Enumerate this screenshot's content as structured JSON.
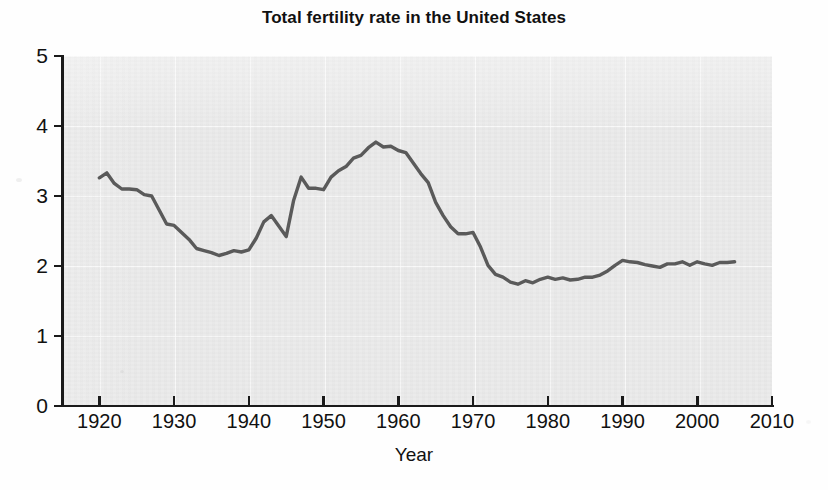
{
  "chart_data": {
    "type": "line",
    "title": "Total fertility rate in the United States",
    "xlabel": "Year",
    "ylabel": "",
    "xlim": [
      1915,
      2010
    ],
    "ylim": [
      0,
      5
    ],
    "xticks": [
      1920,
      1930,
      1940,
      1950,
      1960,
      1970,
      1980,
      1990,
      2000,
      2010
    ],
    "yticks": [
      0,
      1,
      2,
      3,
      4,
      5
    ],
    "grid": true,
    "legend": "none",
    "series": [
      {
        "name": "Total fertility rate",
        "color": "#5a5a5a",
        "x": [
          1920,
          1921,
          1922,
          1923,
          1924,
          1925,
          1926,
          1927,
          1928,
          1929,
          1930,
          1931,
          1932,
          1933,
          1934,
          1935,
          1936,
          1937,
          1938,
          1939,
          1940,
          1941,
          1942,
          1943,
          1944,
          1945,
          1946,
          1947,
          1948,
          1949,
          1950,
          1951,
          1952,
          1953,
          1954,
          1955,
          1956,
          1957,
          1958,
          1959,
          1960,
          1961,
          1962,
          1963,
          1964,
          1965,
          1966,
          1967,
          1968,
          1969,
          1970,
          1971,
          1972,
          1973,
          1974,
          1975,
          1976,
          1977,
          1978,
          1979,
          1980,
          1981,
          1982,
          1983,
          1984,
          1985,
          1986,
          1987,
          1988,
          1989,
          1990,
          1991,
          1992,
          1993,
          1994,
          1995,
          1996,
          1997,
          1998,
          1999,
          2000,
          2001,
          2002,
          2003,
          2004,
          2005
        ],
        "values": [
          3.26,
          3.33,
          3.18,
          3.1,
          3.1,
          3.09,
          3.02,
          3.0,
          2.8,
          2.6,
          2.58,
          2.48,
          2.38,
          2.25,
          2.22,
          2.19,
          2.15,
          2.18,
          2.22,
          2.2,
          2.23,
          2.4,
          2.63,
          2.72,
          2.57,
          2.42,
          2.94,
          3.27,
          3.11,
          3.11,
          3.09,
          3.27,
          3.36,
          3.42,
          3.54,
          3.58,
          3.69,
          3.77,
          3.7,
          3.71,
          3.65,
          3.62,
          3.47,
          3.32,
          3.19,
          2.91,
          2.72,
          2.56,
          2.46,
          2.46,
          2.48,
          2.27,
          2.01,
          1.88,
          1.84,
          1.77,
          1.74,
          1.79,
          1.76,
          1.81,
          1.84,
          1.81,
          1.83,
          1.8,
          1.81,
          1.84,
          1.84,
          1.87,
          1.93,
          2.01,
          2.08,
          2.06,
          2.05,
          2.02,
          2.0,
          1.98,
          2.03,
          2.03,
          2.06,
          2.01,
          2.06,
          2.03,
          2.01,
          2.05,
          2.05,
          2.06
        ]
      }
    ]
  },
  "axes": {
    "y_tick_labels": [
      "5",
      "4",
      "3",
      "2",
      "1",
      "0"
    ],
    "x_tick_labels": [
      "1920",
      "1930",
      "1940",
      "1950",
      "1960",
      "1970",
      "1980",
      "1990",
      "2000",
      "2010"
    ],
    "x_title": "Year"
  },
  "style": {
    "plot_background": "#ebebeb",
    "line_color": "#5a5a5a",
    "axis_color": "#1a1a1a",
    "page_background": "#fefefe"
  }
}
